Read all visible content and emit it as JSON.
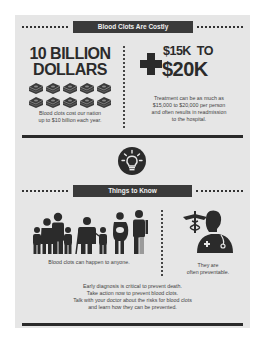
{
  "section1": {
    "header": "Blood Clots Are Costly",
    "left": {
      "headline_line1": "10 BILLION",
      "headline_line2": "DOLLARS",
      "icon": "money-stack-icon",
      "icon_count": 10,
      "caption_line1": "Blood clots cost our nation",
      "caption_line2": "up to $10 billion each year."
    },
    "right": {
      "icon": "medical-cross-icon",
      "headline_line1": "$15K  TO",
      "headline_line2": "$20K",
      "caption_line1": "Treatment can be as much as",
      "caption_line2": "$15,000 to $20,000 per person",
      "caption_line3": "and often results in readmission",
      "caption_line4": "to the hospital."
    }
  },
  "divider_icon": "lightbulb-icon",
  "section2": {
    "header": "Things to Know",
    "left": {
      "icon": "people-group-icon",
      "caption": "Blood clots can happen to anyone."
    },
    "right": {
      "icon": "doctor-icon",
      "caption_line1": "They are",
      "caption_line2": "often preventable."
    },
    "footer_lines": [
      "Early diagnosis is critical to prevent death.",
      "Take action now to prevent blood clots.",
      "Talk with your doctor about the risks for blood clots",
      "and learn how they can be prevented."
    ]
  },
  "colors": {
    "background": "#e6e6e6",
    "dark": "#2b2b2b",
    "header_bar": "#3a3a3a"
  }
}
